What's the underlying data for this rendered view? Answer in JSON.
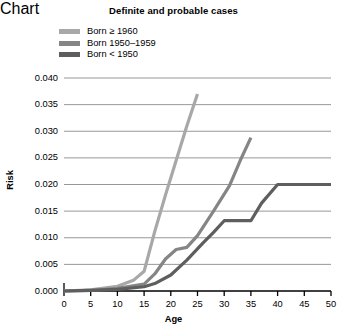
{
  "chart_data": {
    "type": "line",
    "title": "Definite and probable cases",
    "xlabel": "Age",
    "ylabel": "Risk",
    "xlim": [
      0,
      50
    ],
    "ylim": [
      0.0,
      0.04
    ],
    "grid": "horizontal",
    "legend_position": "top-left",
    "xticks": [
      "0",
      "5",
      "10",
      "15",
      "20",
      "25",
      "30",
      "35",
      "40",
      "45",
      "50"
    ],
    "xtick_values": [
      0,
      5,
      10,
      15,
      20,
      25,
      30,
      35,
      40,
      45,
      50
    ],
    "yticks": [
      "0.000",
      "0.005",
      "0.010",
      "0.015",
      "0.020",
      "0.025",
      "0.030",
      "0.035",
      "0.040"
    ],
    "ytick_values": [
      0.0,
      0.005,
      0.01,
      0.015,
      0.02,
      0.025,
      0.03,
      0.035,
      0.04
    ],
    "series": [
      {
        "name": "Born ≥ 1960",
        "color": "#a8a8a8",
        "x": [
          0,
          5,
          10,
          13,
          15,
          17,
          19,
          21,
          23,
          25
        ],
        "values": [
          0.0,
          0.0002,
          0.0009,
          0.002,
          0.0037,
          0.0112,
          0.018,
          0.0245,
          0.031,
          0.037
        ]
      },
      {
        "name": "Born 1950–1959",
        "color": "#858585",
        "x": [
          0,
          5,
          10,
          15,
          17,
          19,
          21,
          23,
          25,
          28,
          31,
          33,
          35
        ],
        "values": [
          0.0,
          0.0001,
          0.0005,
          0.0013,
          0.0032,
          0.006,
          0.0078,
          0.0082,
          0.0104,
          0.015,
          0.0198,
          0.0245,
          0.0288
        ]
      },
      {
        "name": "Born < 1950",
        "color": "#5e5e5e",
        "x": [
          0,
          5,
          10,
          15,
          17,
          20,
          23,
          26,
          28,
          30,
          33,
          35,
          37,
          40,
          45,
          50
        ],
        "values": [
          0.0,
          0.0001,
          0.0003,
          0.0008,
          0.0014,
          0.003,
          0.0058,
          0.009,
          0.011,
          0.0132,
          0.0132,
          0.0132,
          0.0165,
          0.02,
          0.02,
          0.02
        ]
      }
    ]
  },
  "legend": {
    "items": [
      {
        "label": "Born ≥ 1960"
      },
      {
        "label": "Born 1950–1959"
      },
      {
        "label": "Born < 1950"
      }
    ]
  }
}
